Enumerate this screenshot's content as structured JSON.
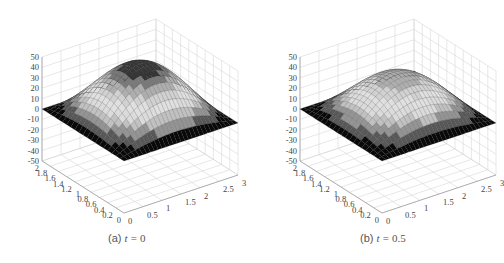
{
  "chart_data": [
    {
      "type": "surface3d",
      "title": "",
      "caption": {
        "prefix": "(a)",
        "var": "t",
        "eq": "=",
        "value": "0"
      },
      "xlabel": "",
      "ylabel": "",
      "zlabel": "",
      "x_range": [
        0,
        3
      ],
      "y_range": [
        0,
        2
      ],
      "z_range": [
        -50,
        50
      ],
      "x_ticks": [
        "0",
        "0.5",
        "1",
        "1.5",
        "2",
        "2.5",
        "3"
      ],
      "y_ticks": [
        "0",
        "0.2",
        "0.4",
        "0.6",
        "0.8",
        "1",
        "1.2",
        "1.4",
        "1.6",
        "1.8",
        "2"
      ],
      "z_ticks": [
        "50",
        "40",
        "30",
        "20",
        "10",
        "0",
        "-10",
        "-20",
        "-30",
        "-40",
        "-50"
      ],
      "peak_value": 50,
      "surface": "z = 50·sin(πx/3)·sin(πy/2)",
      "grid": true,
      "colormap": "gray"
    },
    {
      "type": "surface3d",
      "title": "",
      "caption": {
        "prefix": "(b)",
        "var": "t",
        "eq": "=",
        "value": "0.5"
      },
      "xlabel": "",
      "ylabel": "",
      "zlabel": "",
      "x_range": [
        0,
        3
      ],
      "y_range": [
        0,
        2
      ],
      "z_range": [
        -50,
        50
      ],
      "x_ticks": [
        "0",
        "0.5",
        "1",
        "1.5",
        "2",
        "2.5",
        "3"
      ],
      "y_ticks": [
        "0",
        "0.2",
        "0.4",
        "0.6",
        "0.8",
        "1",
        "1.2",
        "1.4",
        "1.6",
        "1.8",
        "2"
      ],
      "z_ticks": [
        "50",
        "40",
        "30",
        "20",
        "10",
        "0",
        "-10",
        "-20",
        "-30",
        "-40",
        "-50"
      ],
      "peak_value": 40,
      "surface": "z = 40·sin(πx/3)·sin(πy/2)",
      "grid": true,
      "colormap": "gray"
    }
  ],
  "panels": [
    {
      "origin_x": 124,
      "origin_y": 213
    },
    {
      "origin_x": 382,
      "origin_y": 213
    }
  ]
}
